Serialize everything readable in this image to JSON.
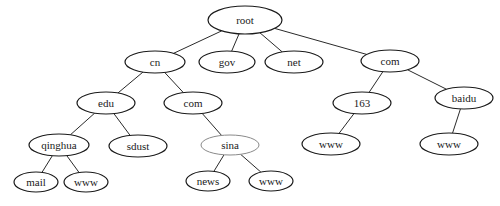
{
  "diagram": {
    "type": "tree",
    "title": "",
    "nodes": [
      {
        "id": "root",
        "label": "root",
        "cx": 245,
        "cy": 20,
        "rx": 37,
        "ry": 14,
        "style": "normal"
      },
      {
        "id": "cn",
        "label": "cn",
        "cx": 155,
        "cy": 62,
        "rx": 30,
        "ry": 11,
        "style": "normal"
      },
      {
        "id": "gov",
        "label": "gov",
        "cx": 227,
        "cy": 62,
        "rx": 28,
        "ry": 11,
        "style": "normal"
      },
      {
        "id": "net",
        "label": "net",
        "cx": 294,
        "cy": 62,
        "rx": 29,
        "ry": 11,
        "style": "normal"
      },
      {
        "id": "com_top",
        "label": "com",
        "cx": 390,
        "cy": 61,
        "rx": 29,
        "ry": 11,
        "style": "normal"
      },
      {
        "id": "edu",
        "label": "edu",
        "cx": 106,
        "cy": 103,
        "rx": 29,
        "ry": 11,
        "style": "normal"
      },
      {
        "id": "com_cn",
        "label": "com",
        "cx": 193,
        "cy": 103,
        "rx": 29,
        "ry": 11,
        "style": "normal"
      },
      {
        "id": "n163",
        "label": "163",
        "cx": 362,
        "cy": 103,
        "rx": 29,
        "ry": 11,
        "style": "normal"
      },
      {
        "id": "baidu",
        "label": "baidu",
        "cx": 464,
        "cy": 98,
        "rx": 29,
        "ry": 11,
        "style": "normal"
      },
      {
        "id": "qinghua",
        "label": "qinghua",
        "cx": 59,
        "cy": 145,
        "rx": 30,
        "ry": 11,
        "style": "normal"
      },
      {
        "id": "sdust",
        "label": "sdust",
        "cx": 138,
        "cy": 146,
        "rx": 29,
        "ry": 11,
        "style": "normal"
      },
      {
        "id": "sina",
        "label": "sina",
        "cx": 230,
        "cy": 145,
        "rx": 29,
        "ry": 10,
        "style": "light"
      },
      {
        "id": "www_163",
        "label": "www",
        "cx": 331,
        "cy": 144,
        "rx": 29,
        "ry": 11,
        "style": "normal"
      },
      {
        "id": "www_baidu",
        "label": "www",
        "cx": 449,
        "cy": 144,
        "rx": 29,
        "ry": 11,
        "style": "normal"
      },
      {
        "id": "mail",
        "label": "mail",
        "cx": 36,
        "cy": 182,
        "rx": 22,
        "ry": 10,
        "style": "normal"
      },
      {
        "id": "www_qinghua",
        "label": "www",
        "cx": 86,
        "cy": 182,
        "rx": 22,
        "ry": 10,
        "style": "normal"
      },
      {
        "id": "news",
        "label": "news",
        "cx": 208,
        "cy": 181,
        "rx": 22,
        "ry": 10,
        "style": "normal"
      },
      {
        "id": "www_sina",
        "label": "www",
        "cx": 271,
        "cy": 181,
        "rx": 22,
        "ry": 10,
        "style": "normal"
      }
    ],
    "edges": [
      {
        "from": "root",
        "to": "cn"
      },
      {
        "from": "root",
        "to": "gov"
      },
      {
        "from": "root",
        "to": "net"
      },
      {
        "from": "root",
        "to": "com_top"
      },
      {
        "from": "cn",
        "to": "edu"
      },
      {
        "from": "cn",
        "to": "com_cn"
      },
      {
        "from": "com_top",
        "to": "n163"
      },
      {
        "from": "com_top",
        "to": "baidu"
      },
      {
        "from": "edu",
        "to": "qinghua"
      },
      {
        "from": "edu",
        "to": "sdust"
      },
      {
        "from": "com_cn",
        "to": "sina"
      },
      {
        "from": "n163",
        "to": "www_163"
      },
      {
        "from": "baidu",
        "to": "www_baidu"
      },
      {
        "from": "qinghua",
        "to": "mail"
      },
      {
        "from": "qinghua",
        "to": "www_qinghua"
      },
      {
        "from": "sina",
        "to": "news"
      },
      {
        "from": "sina",
        "to": "www_sina"
      }
    ]
  }
}
